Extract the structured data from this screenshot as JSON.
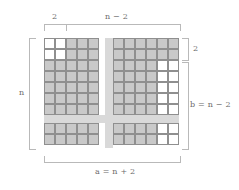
{
  "figure": {
    "title_labels": {
      "top_left": "2",
      "top_right": "n − 2",
      "left": "n",
      "right_top": "2",
      "right_bottom": "b = n − 2",
      "bottom": "a = n + 2"
    },
    "colors": {
      "shaded_fill": "#c9c9c9",
      "plain_fill": "#ffffff",
      "band_fill": "#d9d9d9",
      "cell_stroke": "#8f8f8f",
      "minor_stroke": "#b5b5b5",
      "brace_stroke": "#b9b9b9",
      "text": "#6b6b6b",
      "background": "#ffffff"
    },
    "geometry": {
      "cell_px": 11,
      "square_side_cells": 10,
      "split_left_cells": 2,
      "split_right_cells": 8,
      "band_thickness_px": 7
    }
  },
  "chart_data": {
    "type": "diagram",
    "labels": [
      "2",
      "n − 2",
      "n",
      "2",
      "b = n − 2",
      "a = n + 2"
    ],
    "relations": [
      "a = n + 2",
      "b = n − 2"
    ],
    "pieces": 4
  }
}
